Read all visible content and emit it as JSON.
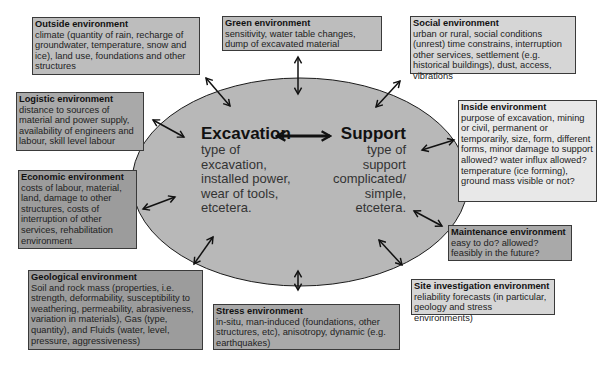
{
  "center": {
    "excavation": {
      "title": "Excavation",
      "lines": [
        "type of",
        "excavation,",
        "installed power,",
        "wear of tools,",
        "etcetera."
      ]
    },
    "support": {
      "title": "Support",
      "lines": [
        "type of",
        "support",
        "complicated/",
        "simple,",
        "etcetera."
      ]
    }
  },
  "boxes": {
    "outside": {
      "title": "Outside environment",
      "body": "climate (quantity of rain, recharge of groundwater, temperature, snow and ice), land use, foundations and other structures"
    },
    "green": {
      "title": "Green  environment",
      "body": "sensitivity, water table changes, dump of excavated material"
    },
    "social": {
      "title": "Social environment",
      "body": "urban or rural, social conditions (unrest) time constrains, interruption other services, settlement (e.g. historical buildings), dust, access, vibrations"
    },
    "logistic": {
      "title": "Logistic environment",
      "body": "distance to sources of material and power supply, availability of engineers and labour, skill level labour"
    },
    "inside": {
      "title": "Inside environment",
      "body": "purpose of excavation, mining or civil, permanent or temporarily, size, form, different forms, minor damage to support allowed? water influx allowed? temperature (ice forming), ground mass visible or not?"
    },
    "economic": {
      "title": "Economic environment",
      "body": "costs of labour, material, land, damage to other structures, costs of interruption of other services, rehabilitation environment"
    },
    "maintenance": {
      "title": "Maintenance  environment",
      "body": "easy to do? allowed? feasibly in  the future?"
    },
    "geological": {
      "title": "Geological environment",
      "body": "Soil and rock mass (properties, i.e. strength, deformability, susceptibility to weathering, permeability, abrasiveness, variation in materials), Gas (type, quantity), and Fluids (water, level, pressure, aggressiveness)"
    },
    "stress": {
      "title": "Stress environment",
      "body": "in-situ, man-induced (foundations, other structures, etc), anisotropy, dynamic (e.g. earthquakes)"
    },
    "site": {
      "title": "Site investigation environment",
      "body": "reliability forecasts (in particular, geology and stress environments)"
    }
  },
  "colors": {
    "ellipse_fill": "#b8b8b8",
    "ellipse_stroke": "#1a1a1a",
    "arrow": "#111111"
  }
}
